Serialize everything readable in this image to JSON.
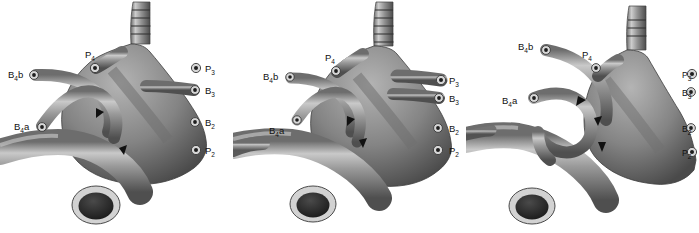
{
  "figure": {
    "background_color": "#ffffff",
    "panel_count": 3,
    "panel_width": 233,
    "panel_height": 233,
    "ink_color": "#111111",
    "tube_mid_gray": "#8a8a8a",
    "tube_dark_gray": "#4a4a4a",
    "tube_light_gray": "#d8d8d8"
  },
  "panels": [
    {
      "id": "panel-a",
      "position": "left",
      "labels": {
        "b4b": {
          "base": "B",
          "sub": "4",
          "suffix": "b"
        },
        "b4a": {
          "base": "B",
          "sub": "4",
          "suffix": "a"
        },
        "p4": {
          "base": "P",
          "sub": "4",
          "suffix": ""
        },
        "p3": {
          "base": "P",
          "sub": "3",
          "suffix": ""
        },
        "b3": {
          "base": "B",
          "sub": "3",
          "suffix": ""
        },
        "b2": {
          "base": "B",
          "sub": "2",
          "suffix": ""
        },
        "p2": {
          "base": "P",
          "sub": "2",
          "suffix": ""
        }
      },
      "arrow_count": 2,
      "trachea_rings": 4
    },
    {
      "id": "panel-b",
      "position": "center",
      "labels": {
        "b4b": {
          "base": "B",
          "sub": "4",
          "suffix": "b"
        },
        "b4a": {
          "base": "B",
          "sub": "4",
          "suffix": "a"
        },
        "p4": {
          "base": "P",
          "sub": "4",
          "suffix": ""
        },
        "p3": {
          "base": "P",
          "sub": "3",
          "suffix": ""
        },
        "b3": {
          "base": "B",
          "sub": "3",
          "suffix": ""
        },
        "b2": {
          "base": "B",
          "sub": "2",
          "suffix": ""
        },
        "p2": {
          "base": "P",
          "sub": "2",
          "suffix": ""
        }
      },
      "arrow_count": 2,
      "trachea_rings": 5
    },
    {
      "id": "panel-c",
      "position": "right",
      "labels": {
        "b4b": {
          "base": "B",
          "sub": "4",
          "suffix": "b"
        },
        "b4a": {
          "base": "B",
          "sub": "4",
          "suffix": "a"
        },
        "p4": {
          "base": "P",
          "sub": "4",
          "suffix": ""
        },
        "p3": {
          "base": "P",
          "sub": "3",
          "suffix": ""
        },
        "b3": {
          "base": "B",
          "sub": "3",
          "suffix": ""
        },
        "b2": {
          "base": "B",
          "sub": "2",
          "suffix": ""
        },
        "p2": {
          "base": "P",
          "sub": "2",
          "suffix": ""
        }
      },
      "arrow_count": 3,
      "trachea_rings": 3
    }
  ]
}
